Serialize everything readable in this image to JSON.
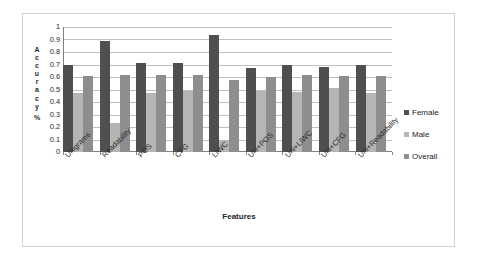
{
  "chart_data": {
    "type": "bar",
    "title": "",
    "xlabel": "Features",
    "ylabel": "Accuracy %",
    "ylim": [
      0,
      1
    ],
    "ytick_labels": [
      "1",
      "0.9",
      "0.8",
      "0.7",
      "0.6",
      "0.5",
      "0.4",
      "0.3",
      "0.2",
      "0.1",
      "0"
    ],
    "ytick_values": [
      1,
      0.9,
      0.8,
      0.7,
      0.6,
      0.5,
      0.4,
      0.3,
      0.2,
      0.1,
      0
    ],
    "grid": true,
    "legend_position": "right",
    "categories": [
      "Unigrams",
      "Readability",
      "POS",
      "CFG",
      "LIWC",
      "Uni+POS",
      "Uni+LIWC",
      "Uni+CFG",
      "Uni+Readability"
    ],
    "series": [
      {
        "name": "Female",
        "color": "#4f4f4f",
        "values": [
          0.7,
          0.885,
          0.715,
          0.71,
          0.935,
          0.67,
          0.7,
          0.68,
          0.7
        ]
      },
      {
        "name": "Male",
        "color": "#b5b5b5",
        "values": [
          0.47,
          0.235,
          0.47,
          0.49,
          0.095,
          0.49,
          0.48,
          0.51,
          0.47
        ]
      },
      {
        "name": "Overall",
        "color": "#8e8e8e",
        "values": [
          0.61,
          0.615,
          0.615,
          0.615,
          0.58,
          0.6,
          0.615,
          0.61,
          0.61
        ]
      }
    ]
  }
}
